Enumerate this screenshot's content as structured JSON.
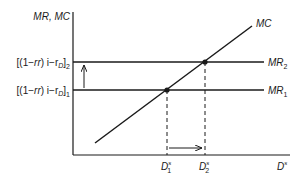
{
  "diagram": {
    "y_axis_label": "MR, MC",
    "x_axis_label": "D",
    "x_axis_label_sup": "s",
    "y_tick_2": {
      "prefix": "[(1−",
      "rr": "rr",
      "mid": ") i−r",
      "sub_d": "D",
      "close": "]",
      "index": "2"
    },
    "y_tick_1": {
      "prefix": "[(1−",
      "rr": "rr",
      "mid": ") i−r",
      "sub_d": "D",
      "close": "]",
      "index": "1"
    },
    "curves": {
      "mc": "MC",
      "mr2": {
        "name": "MR",
        "sub": "2"
      },
      "mr1": {
        "name": "MR",
        "sub": "1"
      }
    },
    "x_ticks": [
      {
        "name": "D",
        "sup": "s",
        "sub": "1"
      },
      {
        "name": "D",
        "sup": "s",
        "sub": "2"
      }
    ],
    "colors": {
      "line": "#1a1a1a",
      "background": "#ffffff"
    }
  }
}
